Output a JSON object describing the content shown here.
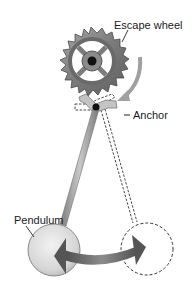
{
  "diagram": {
    "type": "pendulum escapement mechanism",
    "labels": {
      "escape_wheel": "Escape wheel",
      "anchor": "Anchor",
      "pendulum": "Pendulum"
    },
    "colors": {
      "wheel": "#8a8a8a",
      "wheel_dark": "#5a5a5a",
      "anchor": "#b0b0b0",
      "rod": "#9a9a9a",
      "bob_light": "#e8e8e8",
      "arrow": "#6a6a6a",
      "dashed": "#333333",
      "pivot": "#111111"
    }
  }
}
